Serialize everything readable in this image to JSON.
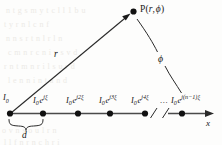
{
  "figure": {
    "colors": {
      "ink": "#171717",
      "axis": "#444444",
      "background": "#fdfdfc",
      "ghost_text": "#eceae6"
    },
    "point_label": {
      "name": "P",
      "text": "P(r, ϕ)",
      "open_paren": "(",
      "radius_symbol": "r",
      "comma": ",",
      "angle_symbol": "ϕ",
      "close_paren": ")"
    },
    "distance_label": "r",
    "angle_label": "ϕ",
    "spacing_label": "d",
    "axis_label": "x",
    "ellipsis": "...",
    "elements": [
      {
        "index": 0,
        "base": "I",
        "subscript": "0",
        "has_exponential": false,
        "exponent": "",
        "label": "I₀",
        "x": 10
      },
      {
        "index": 1,
        "base": "I",
        "subscript": "0",
        "has_exponential": true,
        "exponent": "jξ",
        "label": "I₀e^{jξ}",
        "x": 43
      },
      {
        "index": 2,
        "base": "I",
        "subscript": "0",
        "has_exponential": true,
        "exponent": "j2ξ",
        "label": "I₀e^{j2ξ}",
        "x": 78
      },
      {
        "index": 3,
        "base": "I",
        "subscript": "0",
        "has_exponential": true,
        "exponent": "j3ξ",
        "label": "I₀e^{j3ξ}",
        "x": 110
      },
      {
        "index": 4,
        "base": "I",
        "subscript": "0",
        "has_exponential": true,
        "exponent": "j4ξ",
        "label": "I₀e^{j4ξ}",
        "x": 145
      },
      {
        "index": 5,
        "base": "I",
        "subscript": "0",
        "has_exponential": true,
        "exponent": "j(n−1)ξ",
        "label": "I₀e^{j(n−1)ξ}",
        "x": 182
      }
    ],
    "ghost_lines": [
      {
        "text": "n  t   g  s  m y  t      c  l  l  1 b u",
        "x": 6,
        "y": 6
      },
      {
        "text": "t     y      r   n  l        c  n      f",
        "x": 4,
        "y": 20
      },
      {
        "text": "n    n    s   r   t   n  l   r   l  n",
        "x": 6,
        "y": 34
      },
      {
        "text": "c m    n   r   c n  i  v  s   v    d",
        "x": 8,
        "y": 48
      },
      {
        "text": "r  n  t  m    n  r   i   l  s  u  r   d",
        "x": 4,
        "y": 62
      },
      {
        "text": "l    e   n     n  i   n  t  a  n  d",
        "x": 8,
        "y": 76
      },
      {
        "text": "o   v     n   s  o   u   l    r   n",
        "x": 2,
        "y": 126
      },
      {
        "text": "l   l   f   n  r   n  c   h   r   i",
        "x": 4,
        "y": 138
      }
    ]
  }
}
